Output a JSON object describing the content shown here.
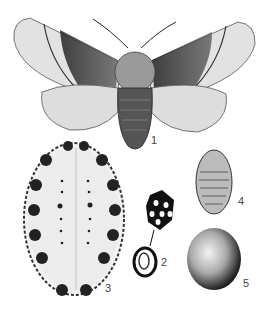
{
  "figure": {
    "labels": {
      "adult_moth": "1",
      "egg_mass": "2",
      "larva": "3",
      "pupa": "4",
      "cocoon": "5"
    }
  }
}
